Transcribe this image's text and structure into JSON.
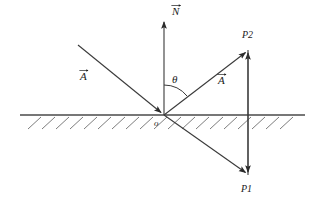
{
  "figure": {
    "type": "physics-ray-reflection-diagram",
    "background_color": "#ffffff",
    "stroke_color": "#3a3a3a",
    "label_color": "#1a1a1a"
  },
  "labels": {
    "normal_vector": "N",
    "incident_vector": "A",
    "reflected_vector": "A",
    "angle": "θ",
    "origin": "o",
    "point_upper": "P2",
    "point_lower": "P1"
  },
  "geometry": {
    "surface_line": {
      "x1": 20,
      "y1": 115,
      "x2": 305,
      "y2": 115
    },
    "origin_point": {
      "x": 164,
      "y": 115
    },
    "normal_arrow": {
      "x1": 164,
      "y1": 115,
      "x2": 164,
      "y2": 18
    },
    "incident_ray": {
      "x1": 78,
      "y1": 45,
      "x2": 164,
      "y2": 115
    },
    "reflected_ray": {
      "x1": 164,
      "y1": 115,
      "x2": 248,
      "y2": 50
    },
    "transmitted_ray": {
      "x1": 164,
      "y1": 115,
      "x2": 248,
      "y2": 175
    },
    "vertical_connector": {
      "x": 248,
      "y_top": 50,
      "y_bottom": 175
    },
    "angle_arc_radius": 30,
    "hatch_start_x": 28,
    "hatch_end_x": 300,
    "hatch_spacing": 14,
    "hatch_length": 13
  }
}
